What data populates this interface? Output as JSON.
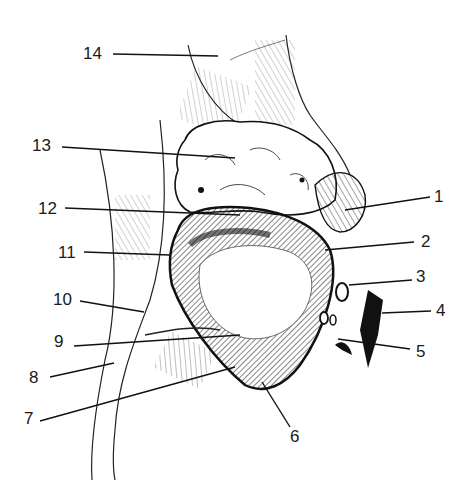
{
  "figure": {
    "type": "anatomical line drawing",
    "labels": [
      {
        "num": "1",
        "x": 434,
        "y": 188
      },
      {
        "num": "2",
        "x": 421,
        "y": 233
      },
      {
        "num": "3",
        "x": 416,
        "y": 268
      },
      {
        "num": "4",
        "x": 436,
        "y": 302
      },
      {
        "num": "5",
        "x": 416,
        "y": 343
      },
      {
        "num": "6",
        "x": 290,
        "y": 428
      },
      {
        "num": "7",
        "x": 24,
        "y": 410
      },
      {
        "num": "8",
        "x": 29,
        "y": 369
      },
      {
        "num": "9",
        "x": 54,
        "y": 333
      },
      {
        "num": "10",
        "x": 53,
        "y": 291
      },
      {
        "num": "11",
        "x": 58,
        "y": 244
      },
      {
        "num": "12",
        "x": 38,
        "y": 200
      },
      {
        "num": "13",
        "x": 32,
        "y": 137
      },
      {
        "num": "14",
        "x": 83,
        "y": 45
      }
    ]
  }
}
